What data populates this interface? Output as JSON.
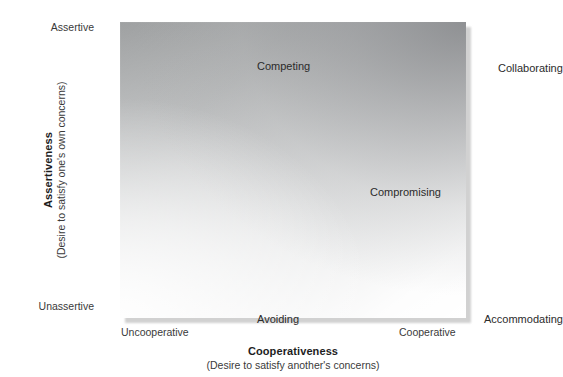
{
  "chart_data": {
    "type": "scatter",
    "title": "",
    "subtitle": "",
    "xlabel": "Cooperativeness",
    "xlabel_sub": "(Desire to satisfy another's concerns)",
    "ylabel": "Assertiveness",
    "ylabel_sub": "(Desire to satisfy one's own concerns)",
    "x_ticks": [
      "Uncooperative",
      "Cooperative"
    ],
    "y_ticks": [
      "Unassertive",
      "Assertive"
    ],
    "xlim": [
      0,
      1
    ],
    "ylim": [
      0,
      1
    ],
    "grid": false,
    "legend": "none",
    "points": [
      {
        "label": "Competing",
        "x": 0.05,
        "y": 0.95
      },
      {
        "label": "Collaborating",
        "x": 0.95,
        "y": 0.95
      },
      {
        "label": "Compromising",
        "x": 0.5,
        "y": 0.5
      },
      {
        "label": "Avoiding",
        "x": 0.05,
        "y": 0.05
      },
      {
        "label": "Accommodating",
        "x": 0.95,
        "y": 0.05
      }
    ],
    "plot_fill": "diagonal-gray-gradient",
    "plot_colors": {
      "top_right": "#8b8d90",
      "top_left": "#b2b4b5",
      "bottom_right": "#c6c7c8",
      "bottom_left": "#fbfbfb",
      "shadow": "#c9c9c9",
      "background": "#ffffff",
      "text": "#231f20"
    }
  },
  "plot": {
    "modes": {
      "competing": "Competing",
      "collaborating": "Collaborating",
      "compromising": "Compromising",
      "avoiding": "Avoiding",
      "accommodating": "Accommodating"
    }
  },
  "axes": {
    "y": {
      "title": "Assertiveness",
      "subtitle": "(Desire to satisfy one's own concerns)",
      "tick_high": "Assertive",
      "tick_low": "Unassertive"
    },
    "x": {
      "title": "Cooperativeness",
      "subtitle": "(Desire to satisfy another's concerns)",
      "tick_low": "Uncooperative",
      "tick_high": "Cooperative"
    }
  }
}
